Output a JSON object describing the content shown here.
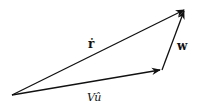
{
  "diagram": {
    "type": "vector-triangle",
    "vectors": [
      {
        "name": "r_dot",
        "label": "ṙ",
        "from": [
          12,
          95
        ],
        "to": [
          185,
          9
        ]
      },
      {
        "name": "V_u_hat",
        "label": "Vû",
        "from": [
          12,
          95
        ],
        "to": [
          162,
          70
        ]
      },
      {
        "name": "w",
        "label": "w",
        "from": [
          162,
          70
        ],
        "to": [
          185,
          9
        ]
      }
    ],
    "labels": {
      "r_dot": "ṙ",
      "w": "w",
      "V_u_hat": "Vû"
    },
    "colors": {
      "stroke": "#111111",
      "background": "#ffffff"
    }
  }
}
